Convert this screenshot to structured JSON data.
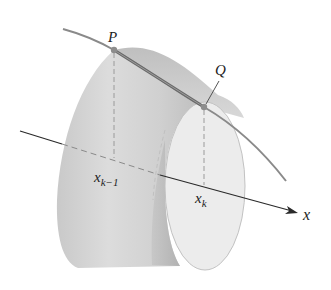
{
  "diagram": {
    "labels": {
      "P": "P",
      "Q": "Q",
      "x_prev_base": "x",
      "x_prev_sub": "k−1",
      "x_k_base": "x",
      "x_k_sub": "k",
      "axis": "x"
    },
    "colors": {
      "surface_light": "#e4e4e4",
      "surface_mid": "#cfcfcf",
      "surface_dark": "#b9b9b9",
      "end_face": "#ececec",
      "curve": "#8a8a8a",
      "segment": "#6e6e6e",
      "axis": "#2a2a2a",
      "dash": "#9a9a9a"
    }
  }
}
